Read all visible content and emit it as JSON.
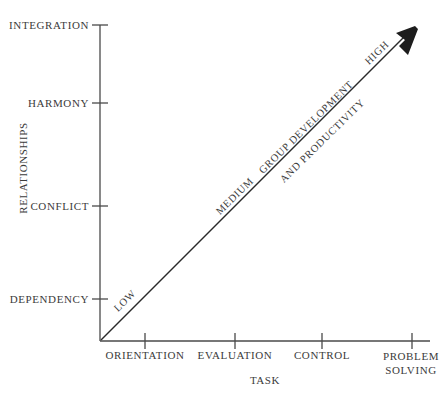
{
  "diagram": {
    "title_implicit": "Group Development and Productivity",
    "axes": {
      "y": {
        "title": "RELATIONSHIPS",
        "ticks": [
          {
            "label": "INTEGRATION",
            "y": 25
          },
          {
            "label": "HARMONY",
            "y": 103
          },
          {
            "label": "CONFLICT",
            "y": 206
          },
          {
            "label": "DEPENDENCY",
            "y": 299
          }
        ]
      },
      "x": {
        "title": "TASK",
        "ticks": [
          {
            "label": "ORIENTATION",
            "x": 145
          },
          {
            "label": "EVALUATION",
            "x": 235
          },
          {
            "label": "CONTROL",
            "x": 322
          },
          {
            "label": "PROBLEM SOLVING",
            "line1": "PROBLEM",
            "line2": "SOLVING",
            "x": 412
          }
        ]
      }
    },
    "arrow": {
      "labels_below": [
        {
          "text": "LOW",
          "x": 116,
          "y": 305
        },
        {
          "text": "MEDIUM",
          "x": 218,
          "y": 208
        },
        {
          "text": "HIGH",
          "x": 367,
          "y": 58
        }
      ],
      "labels_above": [
        {
          "text": "GROUP DEVELOPMENT",
          "x": 261,
          "y": 167
        },
        {
          "text": "AND PRODUCTIVITY",
          "x": 282,
          "y": 176
        }
      ]
    },
    "colors": {
      "ink": "#3b3b3b",
      "line": "#4a4a4a",
      "arrow": "#222222",
      "background": "#ffffff"
    }
  }
}
